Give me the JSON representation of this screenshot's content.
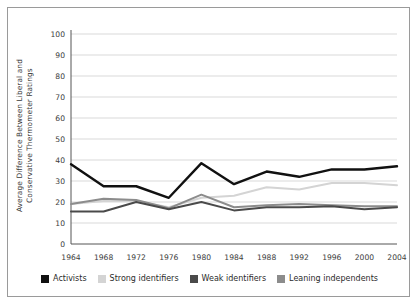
{
  "chart_data": {
    "type": "line",
    "title": "",
    "xlabel": "",
    "ylabel": "Average Difference Between Liberal and Conservative Thermometer Ratings",
    "categories": [
      "1964",
      "1968",
      "1972",
      "1976",
      "1980",
      "1984",
      "1988",
      "1992",
      "1996",
      "2000",
      "2004"
    ],
    "ylim": [
      0,
      100
    ],
    "yticks": [
      "0",
      "10",
      "20",
      "30",
      "40",
      "50",
      "60",
      "70",
      "80",
      "90",
      "100"
    ],
    "grid": "horizontal",
    "legend_position": "bottom",
    "series": [
      {
        "name": "Activists",
        "color": "#111111",
        "values": [
          38,
          27.5,
          27.5,
          22,
          38.5,
          28.5,
          34.5,
          32,
          35.5,
          35.5,
          37
        ]
      },
      {
        "name": "Strong identifiers",
        "color": "#d4d4d4",
        "values": [
          19,
          20.5,
          20.5,
          17.5,
          22,
          23,
          27,
          26,
          29,
          29,
          28
        ]
      },
      {
        "name": "Weak identifiers",
        "color": "#4a4a4a",
        "values": [
          15.5,
          15.5,
          20,
          16.5,
          20,
          16,
          17.5,
          17.5,
          18,
          16.5,
          17.5
        ]
      },
      {
        "name": "Leaning independents",
        "color": "#8c8c8c",
        "values": [
          19,
          21.5,
          21,
          17,
          23.5,
          17.5,
          18.5,
          19,
          18.5,
          18,
          18
        ]
      }
    ]
  },
  "colors": {
    "frame_border": "#9a9a9a",
    "gridline": "#cfcfcf",
    "axis": "#555555",
    "background": "#ffffff",
    "text": "#2b2b2b"
  }
}
